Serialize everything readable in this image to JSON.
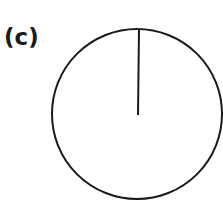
{
  "figure": {
    "panel_label": "(c)",
    "circle": {
      "cx": 137,
      "cy": 114,
      "r": 85,
      "stroke": "#1a1a1a",
      "stroke_width": 2
    },
    "radius_line": {
      "x1": 139,
      "y1": 29,
      "x2": 138,
      "y2": 115,
      "stroke": "#1a1a1a",
      "stroke_width": 2
    }
  }
}
